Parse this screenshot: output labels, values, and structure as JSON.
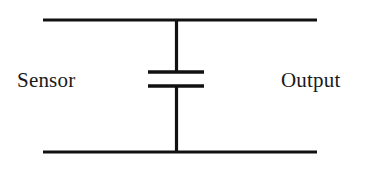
{
  "diagram": {
    "background_color": "#ffffff",
    "line_color": "#111111",
    "labels": {
      "input": "Sensor",
      "output": "Output"
    },
    "components": [
      {
        "name": "capacitor",
        "symbol": "two parallel plates",
        "plate_count": 2,
        "orientation": "horizontal-plates",
        "connection": "shunt between top and bottom rails"
      }
    ],
    "nodes": {
      "top_rail": "horizontal conductor from Sensor side to Output side",
      "bottom_rail": "horizontal ground return conductor",
      "shunt_branch": "vertical conductor containing the capacitor"
    },
    "geometry": {
      "canvas_width": 374,
      "canvas_height": 169,
      "rail_left_x": 43,
      "rail_right_x": 317,
      "top_rail_y": 20,
      "bottom_rail_y": 152,
      "vertical_wire_x": 176.5,
      "plate_left_x": 148,
      "plate_right_x": 204,
      "upper_plate_y": 72,
      "lower_plate_y": 86,
      "rail_stroke_width": 3.2,
      "vertical_stroke_width": 3.2,
      "plate_stroke_width": 3.4
    }
  }
}
